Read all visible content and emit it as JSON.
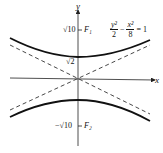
{
  "diagram": {
    "type": "hyperbola",
    "equation": {
      "term1_num": "y²",
      "term1_den": "2",
      "minus": "−",
      "term2_num": "x²",
      "term2_den": "8",
      "rhs": "= 1"
    },
    "axes": {
      "x_label": "x",
      "y_label": "y"
    },
    "labels": {
      "focus_upper_value": "√10",
      "focus_upper_name": "F₁",
      "vertex_upper": "√2",
      "focus_lower_value": "−√10",
      "focus_lower_name": "F₂"
    },
    "colors": {
      "curve": "#111111",
      "asymptote": "#333333",
      "axis": "#222222"
    }
  }
}
